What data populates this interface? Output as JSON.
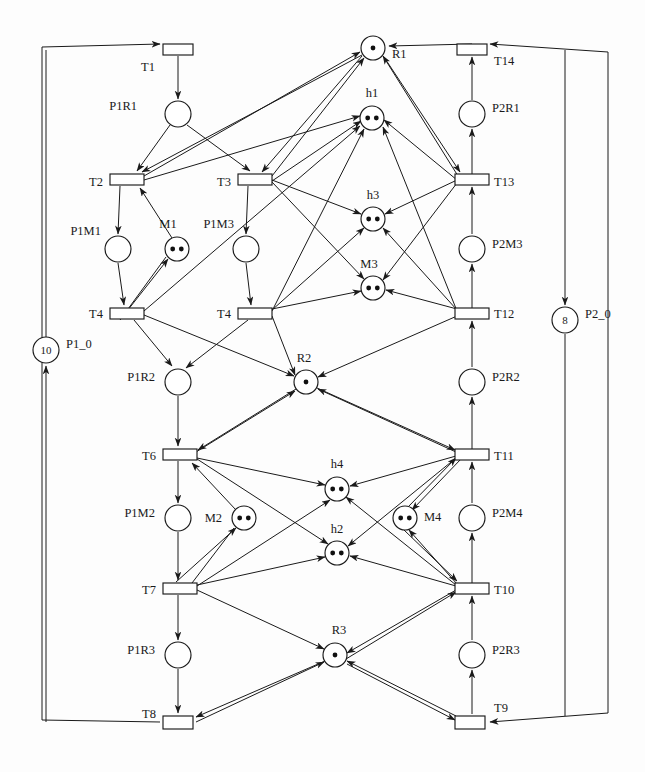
{
  "diagram": {
    "type": "petri-net",
    "width": 645,
    "height": 772,
    "colors": {
      "stroke": "#1a1a1a",
      "fill": "#ffffff",
      "token": "#111111"
    }
  },
  "places": [
    {
      "id": "P1R1",
      "label": "P1R1",
      "cx": 178,
      "cy": 114,
      "r": 13,
      "tokens": 0,
      "token_text": "",
      "label_x": 137,
      "label_y": 110,
      "anchor": "end"
    },
    {
      "id": "R1",
      "label": "R1",
      "cx": 373,
      "cy": 48,
      "r": 12,
      "tokens": 1,
      "token_text": "",
      "label_x": 392,
      "label_y": 58,
      "anchor": "start"
    },
    {
      "id": "P2R1",
      "label": "P2R1",
      "cx": 472,
      "cy": 114,
      "r": 13,
      "tokens": 0,
      "token_text": "",
      "label_x": 492,
      "label_y": 112,
      "anchor": "start"
    },
    {
      "id": "h1",
      "label": "h1",
      "cx": 372,
      "cy": 118,
      "r": 12,
      "tokens": 2,
      "token_text": "",
      "label_x": 372,
      "label_y": 97,
      "anchor": "middle"
    },
    {
      "id": "P1M1",
      "label": "P1M1",
      "cx": 118,
      "cy": 249,
      "r": 13,
      "tokens": 0,
      "token_text": "",
      "label_x": 101,
      "label_y": 235,
      "anchor": "end"
    },
    {
      "id": "M1",
      "label": "M1",
      "cx": 177,
      "cy": 249,
      "r": 12,
      "tokens": 2,
      "token_text": "",
      "label_x": 168,
      "label_y": 228,
      "anchor": "middle"
    },
    {
      "id": "P1M3",
      "label": "P1M3",
      "cx": 246,
      "cy": 249,
      "r": 13,
      "tokens": 0,
      "token_text": "",
      "label_x": 234,
      "label_y": 228,
      "anchor": "end"
    },
    {
      "id": "h3",
      "label": "h3",
      "cx": 373,
      "cy": 219,
      "r": 12,
      "tokens": 2,
      "token_text": "",
      "label_x": 373,
      "label_y": 199,
      "anchor": "middle"
    },
    {
      "id": "M3",
      "label": "M3",
      "cx": 373,
      "cy": 288,
      "r": 12,
      "tokens": 2,
      "token_text": "",
      "label_x": 369,
      "label_y": 268,
      "anchor": "middle"
    },
    {
      "id": "P2M3",
      "label": "P2M3",
      "cx": 472,
      "cy": 249,
      "r": 13,
      "tokens": 0,
      "token_text": "",
      "label_x": 492,
      "label_y": 248,
      "anchor": "start"
    },
    {
      "id": "P1_0",
      "label": "P1_0",
      "cx": 46,
      "cy": 350,
      "r": 13,
      "tokens": 0,
      "token_text": "10",
      "label_x": 66,
      "label_y": 348,
      "anchor": "start"
    },
    {
      "id": "P2_0",
      "label": "P2_0",
      "cx": 565,
      "cy": 320,
      "r": 13,
      "tokens": 0,
      "token_text": "8",
      "label_x": 585,
      "label_y": 318,
      "anchor": "start"
    },
    {
      "id": "P1R2",
      "label": "P1R2",
      "cx": 178,
      "cy": 382,
      "r": 13,
      "tokens": 0,
      "token_text": "",
      "label_x": 155,
      "label_y": 381,
      "anchor": "end"
    },
    {
      "id": "R2",
      "label": "R2",
      "cx": 306,
      "cy": 382,
      "r": 12,
      "tokens": 1,
      "token_text": "",
      "label_x": 304,
      "label_y": 362,
      "anchor": "middle"
    },
    {
      "id": "P2R2",
      "label": "P2R2",
      "cx": 472,
      "cy": 382,
      "r": 13,
      "tokens": 0,
      "token_text": "",
      "label_x": 492,
      "label_y": 381,
      "anchor": "start"
    },
    {
      "id": "P1M2",
      "label": "P1M2",
      "cx": 178,
      "cy": 518,
      "r": 13,
      "tokens": 0,
      "token_text": "",
      "label_x": 155,
      "label_y": 517,
      "anchor": "end"
    },
    {
      "id": "M2",
      "label": "M2",
      "cx": 244,
      "cy": 518,
      "r": 12,
      "tokens": 2,
      "token_text": "",
      "label_x": 222,
      "label_y": 522,
      "anchor": "end"
    },
    {
      "id": "h4",
      "label": "h4",
      "cx": 337,
      "cy": 489,
      "r": 12,
      "tokens": 2,
      "token_text": "",
      "label_x": 337,
      "label_y": 468,
      "anchor": "middle"
    },
    {
      "id": "h2",
      "label": "h2",
      "cx": 337,
      "cy": 553,
      "r": 12,
      "tokens": 2,
      "token_text": "",
      "label_x": 337,
      "label_y": 533,
      "anchor": "middle"
    },
    {
      "id": "M4",
      "label": "M4",
      "cx": 405,
      "cy": 518,
      "r": 12,
      "tokens": 2,
      "token_text": "",
      "label_x": 424,
      "label_y": 521,
      "anchor": "start"
    },
    {
      "id": "P2M4",
      "label": "P2M4",
      "cx": 472,
      "cy": 518,
      "r": 13,
      "tokens": 0,
      "token_text": "",
      "label_x": 492,
      "label_y": 517,
      "anchor": "start"
    },
    {
      "id": "P1R3",
      "label": "P1R3",
      "cx": 178,
      "cy": 655,
      "r": 13,
      "tokens": 0,
      "token_text": "",
      "label_x": 155,
      "label_y": 654,
      "anchor": "end"
    },
    {
      "id": "R3",
      "label": "R3",
      "cx": 335,
      "cy": 655,
      "r": 12,
      "tokens": 1,
      "token_text": "",
      "label_x": 339,
      "label_y": 634,
      "anchor": "middle"
    },
    {
      "id": "P2R3",
      "label": "P2R3",
      "cx": 472,
      "cy": 655,
      "r": 13,
      "tokens": 0,
      "token_text": "",
      "label_x": 492,
      "label_y": 654,
      "anchor": "start"
    }
  ],
  "transitions": [
    {
      "id": "T1",
      "label": "T1",
      "x": 163,
      "y": 44,
      "w": 30,
      "h": 11,
      "label_x": 155,
      "label_y": 71,
      "anchor": "end"
    },
    {
      "id": "T14",
      "label": "T14",
      "x": 457,
      "y": 44,
      "w": 30,
      "h": 11,
      "label_x": 494,
      "label_y": 65,
      "anchor": "start"
    },
    {
      "id": "T2",
      "label": "T2",
      "x": 110,
      "y": 174,
      "w": 34,
      "h": 11,
      "label_x": 103,
      "label_y": 186,
      "anchor": "end"
    },
    {
      "id": "T3",
      "label": "T3",
      "x": 238,
      "y": 174,
      "w": 34,
      "h": 11,
      "label_x": 231,
      "label_y": 186,
      "anchor": "end"
    },
    {
      "id": "T13",
      "label": "T13",
      "x": 455,
      "y": 174,
      "w": 34,
      "h": 11,
      "label_x": 494,
      "label_y": 186,
      "anchor": "start"
    },
    {
      "id": "T4a",
      "label": "T4",
      "x": 110,
      "y": 308,
      "w": 34,
      "h": 11,
      "label_x": 103,
      "label_y": 318,
      "anchor": "end"
    },
    {
      "id": "T4b",
      "label": "T4",
      "x": 238,
      "y": 308,
      "w": 34,
      "h": 11,
      "label_x": 231,
      "label_y": 318,
      "anchor": "end"
    },
    {
      "id": "T12",
      "label": "T12",
      "x": 455,
      "y": 308,
      "w": 34,
      "h": 11,
      "label_x": 494,
      "label_y": 318,
      "anchor": "start"
    },
    {
      "id": "T6",
      "label": "T6",
      "x": 163,
      "y": 449,
      "w": 34,
      "h": 11,
      "label_x": 156,
      "label_y": 460,
      "anchor": "end"
    },
    {
      "id": "T11",
      "label": "T11",
      "x": 455,
      "y": 449,
      "w": 34,
      "h": 11,
      "label_x": 494,
      "label_y": 460,
      "anchor": "start"
    },
    {
      "id": "T7",
      "label": "T7",
      "x": 163,
      "y": 583,
      "w": 34,
      "h": 11,
      "label_x": 156,
      "label_y": 594,
      "anchor": "end"
    },
    {
      "id": "T10",
      "label": "T10",
      "x": 455,
      "y": 583,
      "w": 34,
      "h": 11,
      "label_x": 494,
      "label_y": 594,
      "anchor": "start"
    },
    {
      "id": "T8",
      "label": "T8",
      "x": 163,
      "y": 716,
      "w": 30,
      "h": 13,
      "label_x": 156,
      "label_y": 718,
      "anchor": "end"
    },
    {
      "id": "T9",
      "label": "T9",
      "x": 455,
      "y": 716,
      "w": 30,
      "h": 13,
      "label_x": 494,
      "label_y": 712,
      "anchor": "start"
    }
  ],
  "arcs_straight": [
    {
      "from": "T1",
      "to": "P1R1",
      "x1": 178,
      "y1": 56,
      "x2": 178,
      "y2": 99,
      "arrow": "end"
    },
    {
      "from": "P1R1",
      "to": "T2",
      "x1": 170,
      "y1": 125,
      "x2": 137,
      "y2": 171,
      "arrow": "end"
    },
    {
      "from": "P1R1",
      "to": "T3",
      "x1": 187,
      "y1": 125,
      "x2": 250,
      "y2": 171,
      "arrow": "end"
    },
    {
      "from": "T2",
      "to": "P1M1",
      "x1": 120,
      "y1": 186,
      "x2": 118,
      "y2": 234,
      "arrow": "end"
    },
    {
      "from": "P1M1",
      "to": "T4a",
      "x1": 118,
      "y1": 263,
      "x2": 124,
      "y2": 305,
      "arrow": "end"
    },
    {
      "from": "T4a",
      "to": "M1",
      "x1": 120,
      "y1": 320,
      "x2": 168,
      "y2": 259,
      "arrow": "end"
    },
    {
      "from": "M1",
      "to": "T2",
      "x1": 172,
      "y1": 238,
      "x2": 140,
      "y2": 188,
      "arrow": "end"
    },
    {
      "from": "T3",
      "to": "P1M3",
      "x1": 248,
      "y1": 186,
      "x2": 246,
      "y2": 234,
      "arrow": "end"
    },
    {
      "from": "P1M3",
      "to": "T4b",
      "x1": 246,
      "y1": 263,
      "x2": 251,
      "y2": 305,
      "arrow": "end"
    },
    {
      "from": "T4a",
      "to": "P1R2",
      "x1": 134,
      "y1": 320,
      "x2": 172,
      "y2": 366,
      "arrow": "end"
    },
    {
      "from": "T4b",
      "to": "P1R2",
      "x1": 248,
      "y1": 320,
      "x2": 186,
      "y2": 368,
      "arrow": "end"
    },
    {
      "from": "P1R2",
      "to": "T6",
      "x1": 178,
      "y1": 396,
      "x2": 178,
      "y2": 446,
      "arrow": "end"
    },
    {
      "from": "T6",
      "to": "P1M2",
      "x1": 178,
      "y1": 461,
      "x2": 178,
      "y2": 503,
      "arrow": "end"
    },
    {
      "from": "P1M2",
      "to": "T7",
      "x1": 178,
      "y1": 532,
      "x2": 178,
      "y2": 580,
      "arrow": "end"
    },
    {
      "from": "T7",
      "to": "M2",
      "x1": 176,
      "y1": 582,
      "x2": 236,
      "y2": 528,
      "arrow": "end"
    },
    {
      "from": "M2",
      "to": "T6",
      "x1": 236,
      "y1": 510,
      "x2": 192,
      "y2": 463,
      "arrow": "end"
    },
    {
      "from": "T7",
      "to": "P1R3",
      "x1": 178,
      "y1": 595,
      "x2": 178,
      "y2": 640,
      "arrow": "end"
    },
    {
      "from": "P1R3",
      "to": "T8",
      "x1": 178,
      "y1": 669,
      "x2": 178,
      "y2": 713,
      "arrow": "end"
    },
    {
      "from": "T14",
      "to": "R1",
      "x1": 472,
      "y1": 44,
      "x2": 389,
      "y2": 46,
      "arrow": "end"
    },
    {
      "from": "P2R1",
      "to": "T14",
      "x1": 472,
      "y1": 100,
      "x2": 472,
      "y2": 57,
      "arrow": "end"
    },
    {
      "from": "T13",
      "to": "P2R1",
      "x1": 472,
      "y1": 174,
      "x2": 472,
      "y2": 129,
      "arrow": "end"
    },
    {
      "from": "T12",
      "to": "P2M3",
      "x1": 472,
      "y1": 308,
      "x2": 472,
      "y2": 264,
      "arrow": "end"
    },
    {
      "from": "P2M3",
      "to": "T13",
      "x1": 472,
      "y1": 234,
      "x2": 472,
      "y2": 187,
      "arrow": "end"
    },
    {
      "from": "T11",
      "to": "P2R2",
      "x1": 472,
      "y1": 449,
      "x2": 472,
      "y2": 397,
      "arrow": "end"
    },
    {
      "from": "P2R2",
      "to": "T12",
      "x1": 472,
      "y1": 367,
      "x2": 472,
      "y2": 321,
      "arrow": "end"
    },
    {
      "from": "T10",
      "to": "P2M4",
      "x1": 472,
      "y1": 583,
      "x2": 472,
      "y2": 533,
      "arrow": "end"
    },
    {
      "from": "P2M4",
      "to": "T11",
      "x1": 472,
      "y1": 503,
      "x2": 472,
      "y2": 462,
      "arrow": "end"
    },
    {
      "from": "T9",
      "to": "P2R3",
      "x1": 472,
      "y1": 714,
      "x2": 472,
      "y2": 670,
      "arrow": "end"
    },
    {
      "from": "P2R3",
      "to": "T10",
      "x1": 472,
      "y1": 640,
      "x2": 472,
      "y2": 596,
      "arrow": "end"
    },
    {
      "from": "P1_0",
      "to": "T1",
      "x1": 46,
      "y1": 337,
      "x2": 46,
      "y2": 50,
      "arrow": "none"
    },
    {
      "from": "P2_0",
      "to": "T9",
      "x1": 565,
      "y1": 334,
      "x2": 565,
      "y2": 716,
      "arrow": "none"
    },
    {
      "from": "frame",
      "to": "P2_0",
      "x1": 565,
      "y1": 50,
      "x2": 565,
      "y2": 305,
      "arrow": "end"
    },
    {
      "from": "T8",
      "to": "P1_0",
      "x1": 46,
      "y1": 722,
      "x2": 46,
      "y2": 366,
      "arrow": "end"
    },
    {
      "from": "M1",
      "to": "T4a",
      "x1": 166,
      "y1": 257,
      "x2": 128,
      "y2": 309,
      "arrow": "none"
    },
    {
      "from": "R1",
      "to": "T2",
      "x1": 362,
      "y1": 55,
      "x2": 142,
      "y2": 172,
      "arrow": "end"
    },
    {
      "from": "R1",
      "to": "T3",
      "x1": 362,
      "y1": 56,
      "x2": 262,
      "y2": 172,
      "arrow": "end"
    },
    {
      "from": "R1",
      "to": "T13",
      "x1": 384,
      "y1": 57,
      "x2": 460,
      "y2": 172,
      "arrow": "end"
    },
    {
      "from": "T2",
      "to": "R1",
      "x1": 144,
      "y1": 176,
      "x2": 360,
      "y2": 52,
      "arrow": "end"
    },
    {
      "from": "T3",
      "to": "R1",
      "x1": 272,
      "y1": 176,
      "x2": 364,
      "y2": 58,
      "arrow": "end"
    },
    {
      "from": "T13",
      "to": "R1",
      "x1": 458,
      "y1": 176,
      "x2": 383,
      "y2": 56,
      "arrow": "end"
    },
    {
      "from": "T4a",
      "to": "h1",
      "x1": 144,
      "y1": 311,
      "x2": 360,
      "y2": 126,
      "arrow": "end"
    },
    {
      "from": "T4b",
      "to": "h1",
      "x1": 272,
      "y1": 311,
      "x2": 364,
      "y2": 129,
      "arrow": "end"
    },
    {
      "from": "T12",
      "to": "h1",
      "x1": 457,
      "y1": 311,
      "x2": 383,
      "y2": 127,
      "arrow": "end"
    },
    {
      "from": "T2",
      "to": "h1",
      "x1": 144,
      "y1": 180,
      "x2": 360,
      "y2": 116,
      "arrow": "end"
    },
    {
      "from": "T3",
      "to": "h1",
      "x1": 272,
      "y1": 181,
      "x2": 361,
      "y2": 121,
      "arrow": "end"
    },
    {
      "from": "T13",
      "to": "h1",
      "x1": 457,
      "y1": 180,
      "x2": 384,
      "y2": 120,
      "arrow": "end"
    },
    {
      "from": "T3",
      "to": "h3",
      "x1": 272,
      "y1": 180,
      "x2": 361,
      "y2": 214,
      "arrow": "end"
    },
    {
      "from": "T13",
      "to": "h3",
      "x1": 457,
      "y1": 180,
      "x2": 385,
      "y2": 214,
      "arrow": "end"
    },
    {
      "from": "T4b",
      "to": "h3",
      "x1": 272,
      "y1": 310,
      "x2": 364,
      "y2": 228,
      "arrow": "end"
    },
    {
      "from": "T12",
      "to": "h3",
      "x1": 457,
      "y1": 310,
      "x2": 383,
      "y2": 228,
      "arrow": "end"
    },
    {
      "from": "T3",
      "to": "M3",
      "x1": 272,
      "y1": 182,
      "x2": 364,
      "y2": 279,
      "arrow": "end"
    },
    {
      "from": "T13",
      "to": "M3",
      "x1": 457,
      "y1": 183,
      "x2": 383,
      "y2": 280,
      "arrow": "end"
    },
    {
      "from": "T4b",
      "to": "M3",
      "x1": 272,
      "y1": 309,
      "x2": 361,
      "y2": 291,
      "arrow": "end"
    },
    {
      "from": "T12",
      "to": "M3",
      "x1": 457,
      "y1": 309,
      "x2": 386,
      "y2": 290,
      "arrow": "end"
    },
    {
      "from": "T4a",
      "to": "R2",
      "x1": 144,
      "y1": 315,
      "x2": 294,
      "y2": 376,
      "arrow": "end"
    },
    {
      "from": "T4b",
      "to": "R2",
      "x1": 272,
      "y1": 316,
      "x2": 295,
      "y2": 375,
      "arrow": "end"
    },
    {
      "from": "T12",
      "to": "R2",
      "x1": 457,
      "y1": 316,
      "x2": 318,
      "y2": 377,
      "arrow": "end"
    },
    {
      "from": "R2",
      "to": "T6",
      "x1": 296,
      "y1": 389,
      "x2": 198,
      "y2": 450,
      "arrow": "end"
    },
    {
      "from": "R2",
      "to": "T11",
      "x1": 317,
      "y1": 388,
      "x2": 455,
      "y2": 450,
      "arrow": "end"
    },
    {
      "from": "T6",
      "to": "R2",
      "x1": 196,
      "y1": 452,
      "x2": 295,
      "y2": 391,
      "arrow": "end"
    },
    {
      "from": "T11",
      "to": "R2",
      "x1": 456,
      "y1": 452,
      "x2": 318,
      "y2": 389,
      "arrow": "end"
    },
    {
      "from": "T6",
      "to": "h4",
      "x1": 197,
      "y1": 458,
      "x2": 325,
      "y2": 485,
      "arrow": "end"
    },
    {
      "from": "T11",
      "to": "h4",
      "x1": 456,
      "y1": 456,
      "x2": 350,
      "y2": 486,
      "arrow": "end"
    },
    {
      "from": "T7",
      "to": "h4",
      "x1": 197,
      "y1": 586,
      "x2": 330,
      "y2": 500,
      "arrow": "end"
    },
    {
      "from": "T10",
      "to": "h4",
      "x1": 456,
      "y1": 585,
      "x2": 346,
      "y2": 497,
      "arrow": "end"
    },
    {
      "from": "T6",
      "to": "h2",
      "x1": 197,
      "y1": 459,
      "x2": 328,
      "y2": 544,
      "arrow": "end"
    },
    {
      "from": "T11",
      "to": "h2",
      "x1": 456,
      "y1": 458,
      "x2": 348,
      "y2": 546,
      "arrow": "end"
    },
    {
      "from": "T7",
      "to": "h2",
      "x1": 197,
      "y1": 585,
      "x2": 325,
      "y2": 557,
      "arrow": "end"
    },
    {
      "from": "T10",
      "to": "h2",
      "x1": 456,
      "y1": 586,
      "x2": 350,
      "y2": 556,
      "arrow": "end"
    },
    {
      "from": "T10",
      "to": "M4",
      "x1": 457,
      "y1": 584,
      "x2": 409,
      "y2": 530,
      "arrow": "end"
    },
    {
      "from": "M4",
      "to": "T11",
      "x1": 407,
      "y1": 508,
      "x2": 456,
      "y2": 458,
      "arrow": "end"
    },
    {
      "from": "T11",
      "to": "M4",
      "x1": 461,
      "y1": 459,
      "x2": 412,
      "y2": 510,
      "arrow": "end"
    },
    {
      "from": "M4",
      "to": "T10",
      "x1": 404,
      "y1": 530,
      "x2": 457,
      "y2": 581,
      "arrow": "end"
    },
    {
      "from": "M2",
      "to": "T7",
      "x1": 234,
      "y1": 528,
      "x2": 192,
      "y2": 583,
      "arrow": "none"
    },
    {
      "from": "T7",
      "to": "R3",
      "x1": 197,
      "y1": 590,
      "x2": 324,
      "y2": 649,
      "arrow": "end"
    },
    {
      "from": "R3",
      "to": "T10",
      "x1": 346,
      "y1": 659,
      "x2": 456,
      "y2": 592,
      "arrow": "end"
    },
    {
      "from": "T10",
      "to": "R3",
      "x1": 456,
      "y1": 590,
      "x2": 347,
      "y2": 653,
      "arrow": "end"
    },
    {
      "from": "R3",
      "to": "T8",
      "x1": 325,
      "y1": 661,
      "x2": 196,
      "y2": 717,
      "arrow": "end"
    },
    {
      "from": "T8",
      "to": "R3",
      "x1": 196,
      "y1": 722,
      "x2": 324,
      "y2": 662,
      "arrow": "end"
    },
    {
      "from": "T9",
      "to": "R3",
      "x1": 456,
      "y1": 716,
      "x2": 347,
      "y2": 661,
      "arrow": "end"
    },
    {
      "from": "R3",
      "to": "T9",
      "x1": 347,
      "y1": 664,
      "x2": 455,
      "y2": 720,
      "arrow": "end"
    }
  ],
  "frame": {
    "left_x": 42,
    "right_x": 608,
    "top_y": 44,
    "bottom_y": 722,
    "top_left_to_T1": {
      "x1": 42,
      "y1": 47,
      "x2": 160,
      "y2": 44
    },
    "top_right_to_T14": {
      "x1": 608,
      "y1": 52,
      "x2": 490,
      "y2": 44
    },
    "bottom_left_to_T8": {
      "x1": 42,
      "y1": 720,
      "x2": 160,
      "y2": 722
    },
    "bottom_right_to_T9": {
      "x1": 608,
      "y1": 713,
      "x2": 490,
      "y2": 722
    }
  }
}
